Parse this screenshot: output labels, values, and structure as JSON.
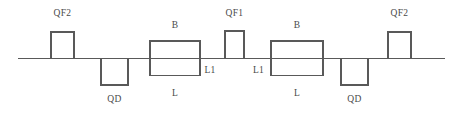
{
  "figure": {
    "width": 466,
    "height": 120,
    "background_color": "#ffffff",
    "line_color": "#595959",
    "text_color": "#4a4a4a",
    "beamline": {
      "name": "beam-axis",
      "x_start": 18,
      "x_end": 445,
      "y": 58.5,
      "stroke_width": 1.4
    }
  },
  "elements": [
    {
      "id": "qf2-left",
      "label": "QF2",
      "kind": "quadrupole-focusing",
      "polarity": "up",
      "x": 51,
      "y": 32,
      "width": 23,
      "height": 26.5,
      "label_x": 62.5,
      "label_y": 9
    },
    {
      "id": "qd-left",
      "label": "QD",
      "kind": "quadrupole-defocusing",
      "polarity": "down",
      "x": 101,
      "y": 58.5,
      "width": 27,
      "height": 26.5,
      "label_x": 114.5,
      "label_y": 95
    },
    {
      "id": "b-left",
      "label": "B",
      "kind": "dipole-bend",
      "polarity": "straddle",
      "x": 150,
      "y": 41,
      "width": 50,
      "height": 34.5,
      "label_x": 175,
      "label_y": 21
    },
    {
      "id": "qf1-center",
      "label": "QF1",
      "kind": "quadrupole-focusing",
      "polarity": "up",
      "x": 225,
      "y": 31,
      "width": 19,
      "height": 27.5,
      "label_x": 234.5,
      "label_y": 9
    },
    {
      "id": "b-right",
      "label": "B",
      "kind": "dipole-bend",
      "polarity": "straddle",
      "x": 271,
      "y": 41,
      "width": 52,
      "height": 34.5,
      "label_x": 297,
      "label_y": 21
    },
    {
      "id": "qd-right",
      "label": "QD",
      "kind": "quadrupole-defocusing",
      "polarity": "down",
      "x": 341,
      "y": 58.5,
      "width": 27,
      "height": 26.5,
      "label_x": 354.5,
      "label_y": 95
    },
    {
      "id": "qf2-right",
      "label": "QF2",
      "kind": "quadrupole-focusing",
      "polarity": "up",
      "x": 388,
      "y": 32,
      "width": 23,
      "height": 26.5,
      "label_x": 399.5,
      "label_y": 9
    }
  ],
  "drift_labels": [
    {
      "id": "l-left",
      "label": "L",
      "x": 175,
      "y": 89
    },
    {
      "id": "l1-left",
      "label": "L1",
      "x": 210,
      "y": 66
    },
    {
      "id": "l1-right",
      "label": "L1",
      "x": 258.5,
      "y": 66
    },
    {
      "id": "l-right",
      "label": "L",
      "x": 297,
      "y": 89
    }
  ]
}
